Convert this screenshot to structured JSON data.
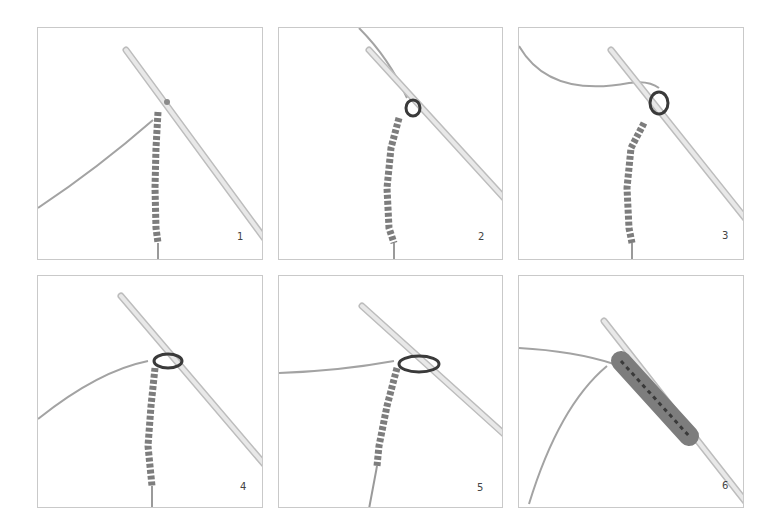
{
  "colors": {
    "border": "#c9c9c9",
    "yarn": "#9a9a9a",
    "chain": "#7d7d7d",
    "hook": "#e2e2e2",
    "hook_edge": "#bdbdbd",
    "dark": "#3a3a3a"
  },
  "panels": [
    {
      "step": "1",
      "x": 37,
      "y": 27,
      "w": 226,
      "h": 233
    },
    {
      "step": "2",
      "x": 278,
      "y": 27,
      "w": 225,
      "h": 233
    },
    {
      "step": "3",
      "x": 518,
      "y": 27,
      "w": 226,
      "h": 233
    },
    {
      "step": "4",
      "x": 37,
      "y": 275,
      "w": 226,
      "h": 233
    },
    {
      "step": "5",
      "x": 278,
      "y": 275,
      "w": 225,
      "h": 233
    },
    {
      "step": "6",
      "x": 518,
      "y": 275,
      "w": 226,
      "h": 233
    }
  ]
}
